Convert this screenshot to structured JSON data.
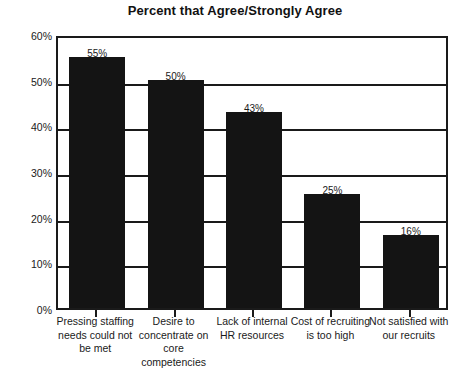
{
  "chart_data": {
    "type": "bar",
    "title": "Percent that Agree/Strongly Agree",
    "xlabel": "",
    "ylabel": "",
    "categories": [
      "Pressing staffing needs could not be met",
      "Desire to concentrate on core competencies",
      "Lack of internal HR resources",
      "Cost of recruiting is too high",
      "Not satisfied with our recruits"
    ],
    "values": [
      55,
      50,
      43,
      25,
      16
    ],
    "value_labels": [
      "55%",
      "50%",
      "43%",
      "25%",
      "16%"
    ],
    "ylim": [
      0,
      60
    ],
    "y_ticks": [
      0,
      10,
      20,
      30,
      40,
      50,
      60
    ],
    "y_tick_labels": [
      "0%",
      "10%",
      "20%",
      "30%",
      "40%",
      "50%",
      "60%"
    ],
    "grid": true,
    "legend": "none",
    "bar_color": "#141414",
    "frame_color": "#1a1a1a",
    "background_color": "#ffffff"
  }
}
